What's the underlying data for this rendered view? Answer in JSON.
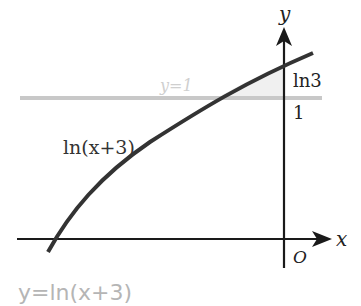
{
  "diagram": {
    "axes": {
      "x_label": "x",
      "y_label": "y",
      "origin_label": "O"
    },
    "y_ticks": [
      {
        "label": "ln3",
        "value": 1.0986
      },
      {
        "label": "1",
        "value": 1
      }
    ],
    "curve": {
      "label": "ln(x+3)",
      "equation": "y = ln(x+3)",
      "color": "#333333"
    },
    "horizontal_line": {
      "label": "y=1",
      "value": 1,
      "color": "#c8c8c8"
    },
    "caption": "y=ln(x+3)",
    "colors": {
      "axis": "#1a1a1a",
      "curve": "#333333",
      "line_y1": "#c8c8c8",
      "caption": "#b5b5b5",
      "text": "#222222"
    }
  }
}
